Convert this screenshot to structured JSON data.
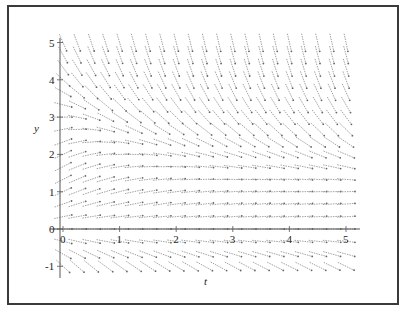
{
  "chart_data": {
    "type": "slope_field",
    "title": "",
    "xlabel": "t",
    "ylabel": "y",
    "xlim": [
      0,
      5
    ],
    "ylim": [
      -1,
      5
    ],
    "x_ticks": [
      "0",
      "1",
      "2",
      "3",
      "4",
      "5"
    ],
    "y_ticks": [
      "-1",
      "0",
      "1",
      "2",
      "3",
      "4",
      "5"
    ],
    "grid": false,
    "legend": null,
    "field_description": "Direction field: gentle positive slopes for 0<y<~2.5, levelling toward y≈1 for large t; steep negative slopes for y above ~3 (steeper as t increases); negative slopes for y<0.",
    "sample_t": [
      0,
      0.25,
      0.5,
      0.75,
      1,
      1.25,
      1.5,
      1.75,
      2,
      2.25,
      2.5,
      2.75,
      3,
      3.25,
      3.5,
      3.75,
      4,
      4.25,
      4.5,
      4.75,
      5
    ],
    "sample_y": [
      -1,
      -0.67,
      -0.33,
      0,
      0.33,
      0.67,
      1,
      1.33,
      1.67,
      2,
      2.33,
      2.67,
      3,
      3.33,
      3.67,
      4,
      4.33,
      4.67,
      5
    ]
  },
  "axes": {
    "t_label": "t",
    "y_label": "y",
    "origin_t_label": "0",
    "origin_y_label": "0"
  },
  "colors": {
    "frame": "#3a3a3a",
    "axis": "#555555",
    "arrows": "#8a8a8a"
  }
}
